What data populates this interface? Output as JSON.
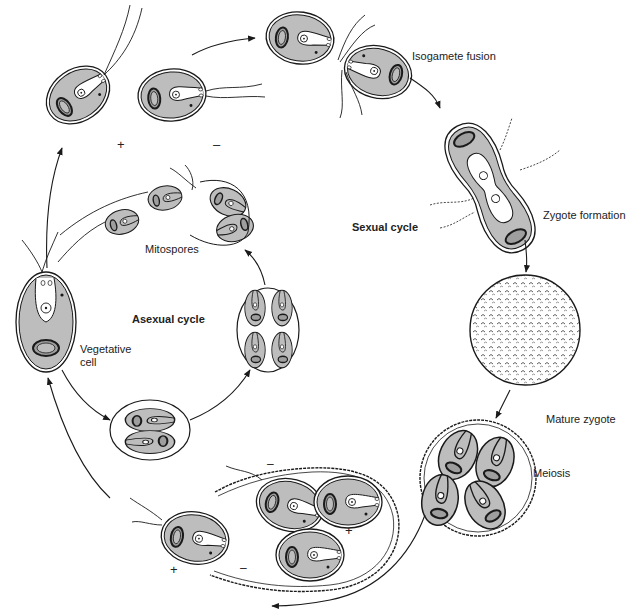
{
  "diagram": {
    "colors": {
      "cell_fill": "#bdbdbd",
      "line": "#1a1a1a",
      "background": "#ffffff",
      "lumen": "#ffffff"
    },
    "cycles": {
      "sexual": "Sexual cycle",
      "asexual": "Asexual cycle"
    },
    "labels": {
      "isogamete_fusion": "Isogamete fusion",
      "zygote_formation": "Zygote formation",
      "mature_zygote": "Mature zygote",
      "meiosis": "Meiosis",
      "mitospores": "Mitospores",
      "vegetative_cell_line1": "Vegetative",
      "vegetative_cell_line2": "cell"
    },
    "mating_signs": {
      "plus": "+",
      "minus": "–"
    },
    "stages": [
      {
        "id": "vegetative-cell",
        "cycle": "both"
      },
      {
        "id": "gametes-plus-minus",
        "cycle": "sexual"
      },
      {
        "id": "isogamete-fusion",
        "cycle": "sexual"
      },
      {
        "id": "zygote-formation",
        "cycle": "sexual"
      },
      {
        "id": "mature-zygote",
        "cycle": "sexual"
      },
      {
        "id": "meiosis",
        "cycle": "sexual"
      },
      {
        "id": "release-of-meiospores",
        "cycle": "sexual"
      },
      {
        "id": "cell-division-2",
        "cycle": "asexual"
      },
      {
        "id": "cell-division-4",
        "cycle": "asexual"
      },
      {
        "id": "mitospores",
        "cycle": "asexual"
      }
    ]
  }
}
